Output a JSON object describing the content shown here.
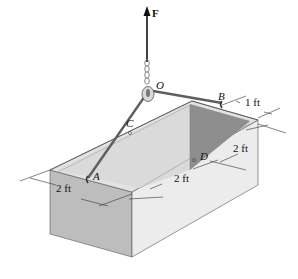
{
  "diagram": {
    "type": "statics-3d-box-lift",
    "force": {
      "label": "F"
    },
    "points": {
      "O": {
        "label": "O"
      },
      "A": {
        "label": "A"
      },
      "B": {
        "label": "B"
      },
      "C": {
        "label": "C"
      },
      "D": {
        "label": "D"
      }
    },
    "dimensions": {
      "front_width": "2 ft",
      "side_length": "2 ft",
      "side_height": "2 ft",
      "b_offset": "1 ft"
    },
    "colors": {
      "outer_face_left": "#bdbdbd",
      "outer_face_right": "#e8e8e8",
      "top_rim": "#e0e0e0",
      "inner_wall_light": "#dcdcdc",
      "inner_wall_dark": "#8c8c8c",
      "rope": "#6a6a6a",
      "line": "#222222"
    }
  }
}
